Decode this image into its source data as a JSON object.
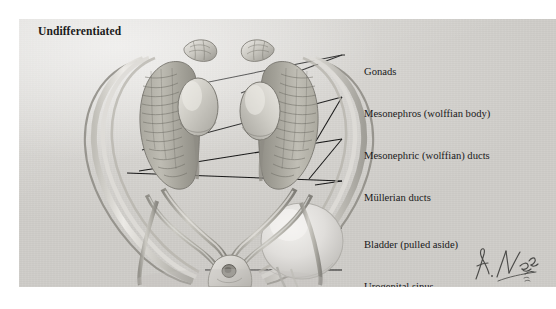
{
  "figure": {
    "title": "Undifferentiated",
    "artist_signature": "F. Netter",
    "background_color": "#d6d4d0",
    "plate_border_color": "#ffffff",
    "leader_line_color": "#141414",
    "label_text_color": "#19191a"
  },
  "labels": [
    {
      "id": "gonads",
      "text": "Gonads",
      "x": 345,
      "y": 48,
      "leader": {
        "x1": 328,
        "y1": 55,
        "x2": 342,
        "y2": 53
      }
    },
    {
      "id": "mesonephros",
      "text": "Mesonephros (wolffian body)",
      "x": 345,
      "y": 90,
      "leader": {
        "x1": 328,
        "y1": 97,
        "x2": 342,
        "y2": 96
      }
    },
    {
      "id": "mesonephric-ducts",
      "text": "Mesonephric (wolffian) ducts",
      "x": 345,
      "y": 132,
      "leader": {
        "x1": 328,
        "y1": 139,
        "x2": 342,
        "y2": 138
      }
    },
    {
      "id": "mullerian-ducts",
      "text": "Müllerian ducts",
      "x": 345,
      "y": 174,
      "leader": {
        "x1": 328,
        "y1": 181,
        "x2": 342,
        "y2": 180
      }
    },
    {
      "id": "bladder",
      "text": "Bladder (pulled aside)",
      "x": 345,
      "y": 221,
      "leader": {
        "x1": 328,
        "y1": 228,
        "x2": 342,
        "y2": 227
      }
    },
    {
      "id": "urogenital-sinus",
      "text": "Urogenital sinus",
      "x": 345,
      "y": 263,
      "leader": {
        "x1": 328,
        "y1": 270,
        "x2": 342,
        "y2": 269
      }
    }
  ],
  "anatomy": {
    "structures": [
      "gonad-left",
      "gonad-right",
      "mesonephros-left",
      "mesonephros-right",
      "mesonephric-duct-left",
      "mesonephric-duct-right",
      "mullerian-duct-left",
      "mullerian-duct-right",
      "bladder",
      "urogenital-sinus",
      "adrenal-left",
      "adrenal-right"
    ]
  }
}
